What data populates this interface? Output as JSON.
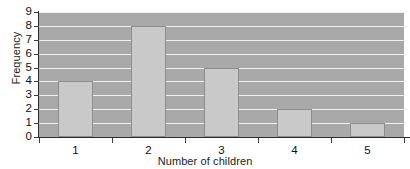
{
  "chart_data": {
    "type": "bar",
    "title": "",
    "xlabel": "Number of children",
    "ylabel": "Frequency",
    "categories": [
      "1",
      "2",
      "3",
      "4",
      "5"
    ],
    "values": [
      4,
      8,
      5,
      2,
      1
    ],
    "ylim": [
      0,
      9
    ],
    "ytick_labels": [
      "0",
      "1",
      "2",
      "3",
      "4",
      "5",
      "6",
      "7",
      "8",
      "9"
    ],
    "ytick_values": [
      0,
      1,
      2,
      3,
      4,
      5,
      6,
      7,
      8,
      9
    ],
    "grid": true,
    "grid_orientation": "horizontal",
    "legend": false,
    "legend_position": "none",
    "colors": {
      "bar_fill": "#c9c9c9",
      "bar_edge": "#8d8d8d",
      "plot_background": "#a9a9a9",
      "gridline": "#f2f2f2",
      "axis": "#2b2b2b",
      "text": "#111111",
      "page_background": "#ffffff"
    }
  }
}
